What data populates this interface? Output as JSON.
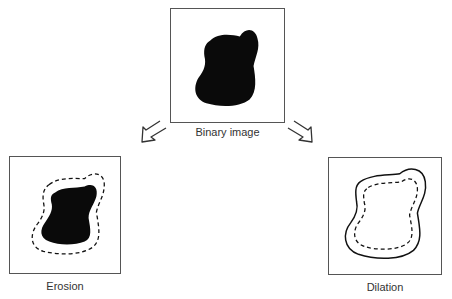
{
  "diagram": {
    "panels": [
      {
        "id": "binary",
        "label": "Binary image"
      },
      {
        "id": "erosion",
        "label": "Erosion"
      },
      {
        "id": "dilation",
        "label": "Dilation"
      }
    ],
    "arrows": [
      {
        "from": "binary",
        "to": "erosion",
        "direction": "down-left"
      },
      {
        "from": "binary",
        "to": "dilation",
        "direction": "down-right"
      }
    ],
    "colors": {
      "shape_fill": "#0a0a0a",
      "frame": "#555555",
      "outline": "#111111"
    }
  }
}
